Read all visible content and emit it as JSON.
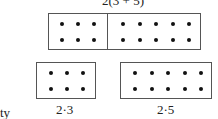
{
  "top": {
    "label": "2(3 + 5)",
    "rows": 2,
    "left_cols": 3,
    "right_cols": 5
  },
  "bottom_left": {
    "label": "2·3",
    "rows": 2,
    "cols": 3
  },
  "bottom_right": {
    "label": "2·5",
    "rows": 2,
    "cols": 5
  },
  "side_text": "ty"
}
